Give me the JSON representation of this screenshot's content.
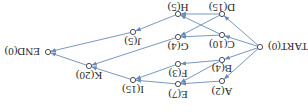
{
  "diagram": {
    "type": "activity-network",
    "orientation": "rotated-180",
    "colors": {
      "edge": "#6a8bb8",
      "node_stroke": "#3a3a3a",
      "text": "#2a2a2a",
      "background": "#ffffff"
    },
    "nodes": [
      {
        "id": "START",
        "label": "START(0)",
        "x": 260,
        "y": 47,
        "lx": 268,
        "ly": 51,
        "anchor": "start"
      },
      {
        "id": "A",
        "label": "A(2)",
        "x": 222,
        "y": 81,
        "lx": 222,
        "ly": 96,
        "anchor": "middle"
      },
      {
        "id": "B",
        "label": "B(4)",
        "x": 222,
        "y": 60,
        "lx": 222,
        "ly": 73,
        "anchor": "middle"
      },
      {
        "id": "C",
        "label": "C(10)",
        "x": 222,
        "y": 35,
        "lx": 222,
        "ly": 49,
        "anchor": "middle"
      },
      {
        "id": "D",
        "label": "D(15)",
        "x": 222,
        "y": 14,
        "lx": 222,
        "ly": 12,
        "anchor": "middle"
      },
      {
        "id": "E",
        "label": "E(7)",
        "x": 178,
        "y": 84,
        "lx": 178,
        "ly": 99,
        "anchor": "middle"
      },
      {
        "id": "F",
        "label": "F(3)",
        "x": 178,
        "y": 64,
        "lx": 178,
        "ly": 78,
        "anchor": "middle"
      },
      {
        "id": "G",
        "label": "G(4)",
        "x": 178,
        "y": 37,
        "lx": 178,
        "ly": 51,
        "anchor": "middle"
      },
      {
        "id": "H",
        "label": "H(5)",
        "x": 178,
        "y": 14,
        "lx": 178,
        "ly": 12,
        "anchor": "middle"
      },
      {
        "id": "I",
        "label": "I(15)",
        "x": 133,
        "y": 80,
        "lx": 133,
        "ly": 94,
        "anchor": "middle"
      },
      {
        "id": "J",
        "label": "J(5)",
        "x": 133,
        "y": 32,
        "lx": 133,
        "ly": 46,
        "anchor": "middle"
      },
      {
        "id": "K",
        "label": "K(20)",
        "x": 89,
        "y": 66,
        "lx": 89,
        "ly": 80,
        "anchor": "middle"
      },
      {
        "id": "END",
        "label": "END(0)",
        "x": 48,
        "y": 52,
        "lx": 40,
        "ly": 56,
        "anchor": "end"
      }
    ],
    "edges": [
      {
        "from": "START",
        "to": "A"
      },
      {
        "from": "START",
        "to": "B"
      },
      {
        "from": "START",
        "to": "C"
      },
      {
        "from": "START",
        "to": "D"
      },
      {
        "from": "A",
        "to": "E"
      },
      {
        "from": "B",
        "to": "E"
      },
      {
        "from": "B",
        "to": "F"
      },
      {
        "from": "C",
        "to": "G"
      },
      {
        "from": "C",
        "to": "H"
      },
      {
        "from": "D",
        "to": "G"
      },
      {
        "from": "D",
        "to": "H"
      },
      {
        "from": "E",
        "to": "I"
      },
      {
        "from": "F",
        "to": "I"
      },
      {
        "from": "G",
        "to": "K"
      },
      {
        "from": "H",
        "to": "J"
      },
      {
        "from": "I",
        "to": "K"
      },
      {
        "from": "K",
        "to": "END"
      },
      {
        "from": "J",
        "to": "END"
      }
    ]
  }
}
